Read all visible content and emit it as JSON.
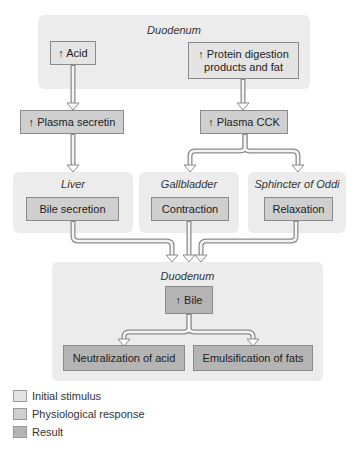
{
  "diagram": {
    "top_panel": {
      "title": "Duodenum",
      "acid": "↑ Acid",
      "protein": "↑ Protein digestion products and fat"
    },
    "hormones": {
      "secretin": "↑ Plasma secretin",
      "cck": "↑ Plasma CCK"
    },
    "organs": [
      {
        "title": "Liver",
        "action": "Bile secretion"
      },
      {
        "title": "Gallbladder",
        "action": "Contraction"
      },
      {
        "title": "Sphincter of Oddi",
        "action": "Relaxation"
      }
    ],
    "bottom_panel": {
      "title": "Duodenum",
      "bile": "↑ Bile",
      "results": [
        "Neutralization of acid",
        "Emulsification of fats"
      ]
    }
  },
  "legend": [
    {
      "label": "Initial stimulus",
      "color": "#e4e4e4"
    },
    {
      "label": "Physiological response",
      "color": "#cfcfcf"
    },
    {
      "label": "Result",
      "color": "#b4b4b4"
    }
  ]
}
